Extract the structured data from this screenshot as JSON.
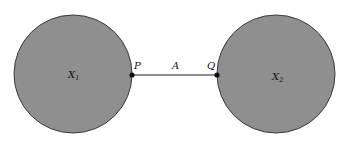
{
  "diagram": {
    "regions": [
      {
        "id": "X1",
        "label": "X",
        "subscript": "1",
        "fill": "#8f8f8f",
        "stroke": "#3a3a3a"
      },
      {
        "id": "X2",
        "label": "X",
        "subscript": "2",
        "fill": "#8f8f8f",
        "stroke": "#3a3a3a"
      }
    ],
    "points": [
      {
        "id": "P",
        "label": "P"
      },
      {
        "id": "Q",
        "label": "Q"
      }
    ],
    "arc": {
      "label": "A"
    }
  }
}
